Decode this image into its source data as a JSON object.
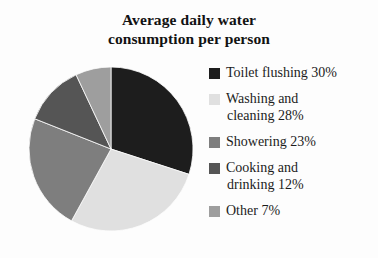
{
  "title": {
    "line1": "Average daily water",
    "line2": "consumption per person"
  },
  "legend": {
    "items": [
      {
        "label": "Toilet flushing 30%",
        "line1": "Toilet flushing 30%",
        "line2": "",
        "color": "#1d1d1d",
        "swatch_name": "legend-swatch-toilet-flushing"
      },
      {
        "label": "Washing and cleaning 28%",
        "line1": "Washing and",
        "line2": "cleaning 28%",
        "color": "#e0e0e0",
        "swatch_name": "legend-swatch-washing-and-cleaning"
      },
      {
        "label": "Showering 23%",
        "line1": "Showering 23%",
        "line2": "",
        "color": "#7e7e7e",
        "swatch_name": "legend-swatch-showering"
      },
      {
        "label": "Cooking and drinking 12%",
        "line1": "Cooking and",
        "line2": "drinking 12%",
        "color": "#555555",
        "swatch_name": "legend-swatch-cooking-and-drinking"
      },
      {
        "label": "Other 7%",
        "line1": "Other 7%",
        "line2": "",
        "color": "#9e9e9e",
        "swatch_name": "legend-swatch-other"
      }
    ]
  },
  "chart_data": {
    "type": "pie",
    "title": "Average daily water consumption per person",
    "unit": "%",
    "start_angle_deg": 0,
    "direction": "clockwise",
    "categories": [
      "Toilet flushing",
      "Washing and cleaning",
      "Showering",
      "Cooking and drinking",
      "Other"
    ],
    "values": [
      30,
      28,
      23,
      12,
      7
    ],
    "labels": [
      "Toilet flushing 30%",
      "Washing and cleaning 28%",
      "Showering 23%",
      "Cooking and drinking 12%",
      "Other 7%"
    ],
    "colors": [
      "#1d1d1d",
      "#e0e0e0",
      "#7e7e7e",
      "#555555",
      "#9e9e9e"
    ],
    "legend_position": "right",
    "grid": false,
    "xlabel": "",
    "ylabel": ""
  },
  "geometry": {
    "center_x": 83,
    "center_y": 82,
    "radius": 82
  }
}
